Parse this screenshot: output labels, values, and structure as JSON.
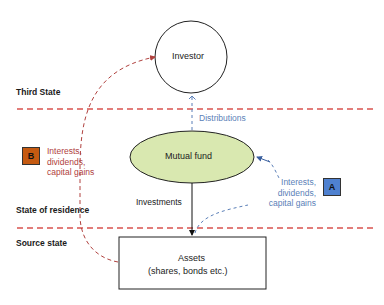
{
  "zones": {
    "third_state": "Third State",
    "state_of_residence": "State of residence",
    "source_state": "Source state"
  },
  "nodes": {
    "investor": "Investor",
    "mutual_fund": "Mutual fund",
    "assets_line1": "Assets",
    "assets_line2": "(shares, bonds etc.)"
  },
  "flows": {
    "distributions": "Distributions",
    "investments": "Investments",
    "b_badge": "B",
    "b_lines": [
      "Interests,",
      "dividends,",
      "capital gains"
    ],
    "a_badge": "A",
    "a_lines": [
      "Interests,",
      "dividends,",
      "capital gains"
    ]
  },
  "colors": {
    "boundary_line": "#d9534f",
    "flow_b": "#b0413e",
    "flow_a": "#5b7fb8",
    "badge_b_fill": "#c55a11",
    "badge_a_fill": "#4f81d0",
    "mutual_fund_fill": "#d9e8b0"
  }
}
